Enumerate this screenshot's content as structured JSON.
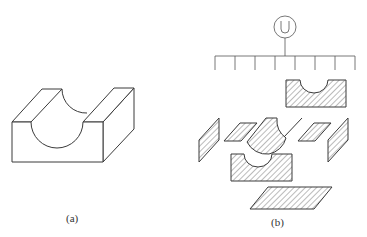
{
  "figure": {
    "panel_a": {
      "label": "(a)",
      "description": "Isometric block with semicircular U-shaped groove cut through the top"
    },
    "panel_b": {
      "label": "(b)",
      "root_symbol": "U",
      "tree_branch_count": 8,
      "exploded_faces": [
        "back-face-u-profile",
        "left-side-face",
        "left-top-strip",
        "curved-groove-surface",
        "right-top-strip",
        "right-side-face",
        "front-face-u-profile",
        "bottom-face"
      ]
    },
    "colors": {
      "stroke": "#3a3a3a",
      "background": "#ffffff",
      "hatch": "#555555"
    }
  }
}
